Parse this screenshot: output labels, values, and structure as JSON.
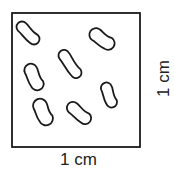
{
  "diagram": {
    "square": {
      "x": 12,
      "y": 13,
      "width": 128,
      "height": 134,
      "stroke": "#1a1a1a"
    },
    "cell_count": 7,
    "cells": [
      {
        "id": 1,
        "cx": 28,
        "cy": 33,
        "length": 28,
        "width": 11,
        "angle": 45
      },
      {
        "id": 2,
        "cx": 102,
        "cy": 39,
        "length": 28,
        "width": 13,
        "angle": 35
      },
      {
        "id": 3,
        "cx": 70,
        "cy": 64,
        "length": 32,
        "width": 11,
        "angle": 55
      },
      {
        "id": 4,
        "cx": 34,
        "cy": 77,
        "length": 28,
        "width": 13,
        "angle": 65
      },
      {
        "id": 5,
        "cx": 109,
        "cy": 95,
        "length": 26,
        "width": 11,
        "angle": 70
      },
      {
        "id": 6,
        "cx": 43,
        "cy": 112,
        "length": 28,
        "width": 14,
        "angle": 65
      },
      {
        "id": 7,
        "cx": 79,
        "cy": 113,
        "length": 28,
        "width": 12,
        "angle": 40
      }
    ],
    "bottom_label": "1 cm",
    "side_label": "1 cm"
  }
}
